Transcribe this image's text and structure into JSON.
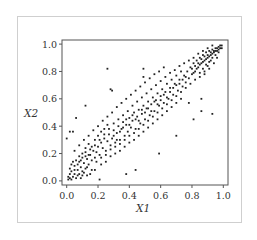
{
  "chart_data": {
    "type": "scatter",
    "title": "",
    "xlabel": "X1",
    "ylabel": "X2",
    "xlim": [
      -0.03,
      1.03
    ],
    "ylim": [
      -0.03,
      1.03
    ],
    "xticks": [
      0.0,
      0.2,
      0.4,
      0.6,
      0.8,
      1.0
    ],
    "yticks": [
      0.0,
      0.2,
      0.4,
      0.6,
      0.8,
      1.0
    ],
    "xtick_labels": [
      "0.0",
      "0.2",
      "0.4",
      "0.6",
      "0.8",
      "1.0"
    ],
    "ytick_labels": [
      "0.0",
      "0.2",
      "0.4",
      "0.6",
      "0.8",
      "1.0"
    ],
    "grid": false,
    "legend": null,
    "marker_color": "#222222",
    "series": [
      {
        "name": "samples",
        "description": "Strongly positively correlated bivariate sample on [0,1]x[0,1], dense near (0,0) and (1,1)",
        "points": [
          [
            0.26,
            0.82
          ],
          [
            0.49,
            0.82
          ],
          [
            0.12,
            0.55
          ],
          [
            0.06,
            0.46
          ],
          [
            0.0,
            0.31
          ],
          [
            0.02,
            0.36
          ],
          [
            0.04,
            0.36
          ],
          [
            0.93,
            0.49
          ],
          [
            0.81,
            0.45
          ],
          [
            0.7,
            0.33
          ],
          [
            0.59,
            0.2
          ],
          [
            0.44,
            0.08
          ],
          [
            0.38,
            0.05
          ],
          [
            0.21,
            0.01
          ],
          [
            0.86,
            0.51
          ],
          [
            0.78,
            0.57
          ],
          [
            0.86,
            0.6
          ],
          [
            0.49,
            0.76
          ],
          [
            0.28,
            0.67
          ],
          [
            0.29,
            0.66
          ],
          [
            0.01,
            0.01
          ],
          [
            0.02,
            0.02
          ],
          [
            0.01,
            0.03
          ],
          [
            0.03,
            0.01
          ],
          [
            0.02,
            0.05
          ],
          [
            0.04,
            0.03
          ],
          [
            0.03,
            0.07
          ],
          [
            0.05,
            0.05
          ],
          [
            0.06,
            0.02
          ],
          [
            0.02,
            0.09
          ],
          [
            0.07,
            0.08
          ],
          [
            0.05,
            0.11
          ],
          [
            0.08,
            0.05
          ],
          [
            0.09,
            0.1
          ],
          [
            0.1,
            0.07
          ],
          [
            0.04,
            0.14
          ],
          [
            0.06,
            0.15
          ],
          [
            0.11,
            0.13
          ],
          [
            0.12,
            0.09
          ],
          [
            0.13,
            0.16
          ],
          [
            0.14,
            0.12
          ],
          [
            0.15,
            0.19
          ],
          [
            0.08,
            0.18
          ],
          [
            0.1,
            0.2
          ],
          [
            0.16,
            0.15
          ],
          [
            0.17,
            0.22
          ],
          [
            0.18,
            0.17
          ],
          [
            0.12,
            0.24
          ],
          [
            0.14,
            0.27
          ],
          [
            0.19,
            0.21
          ],
          [
            0.2,
            0.25
          ],
          [
            0.21,
            0.19
          ],
          [
            0.22,
            0.28
          ],
          [
            0.23,
            0.24
          ],
          [
            0.24,
            0.31
          ],
          [
            0.25,
            0.22
          ],
          [
            0.26,
            0.29
          ],
          [
            0.27,
            0.34
          ],
          [
            0.28,
            0.26
          ],
          [
            0.29,
            0.31
          ],
          [
            0.3,
            0.37
          ],
          [
            0.31,
            0.28
          ],
          [
            0.32,
            0.35
          ],
          [
            0.33,
            0.4
          ],
          [
            0.34,
            0.3
          ],
          [
            0.35,
            0.38
          ],
          [
            0.36,
            0.43
          ],
          [
            0.37,
            0.33
          ],
          [
            0.38,
            0.41
          ],
          [
            0.39,
            0.36
          ],
          [
            0.4,
            0.46
          ],
          [
            0.41,
            0.39
          ],
          [
            0.42,
            0.44
          ],
          [
            0.43,
            0.5
          ],
          [
            0.44,
            0.38
          ],
          [
            0.45,
            0.47
          ],
          [
            0.46,
            0.52
          ],
          [
            0.47,
            0.42
          ],
          [
            0.48,
            0.49
          ],
          [
            0.49,
            0.55
          ],
          [
            0.5,
            0.45
          ],
          [
            0.51,
            0.53
          ],
          [
            0.52,
            0.58
          ],
          [
            0.53,
            0.48
          ],
          [
            0.54,
            0.56
          ],
          [
            0.55,
            0.61
          ],
          [
            0.56,
            0.51
          ],
          [
            0.57,
            0.59
          ],
          [
            0.58,
            0.64
          ],
          [
            0.59,
            0.55
          ],
          [
            0.6,
            0.62
          ],
          [
            0.61,
            0.67
          ],
          [
            0.62,
            0.57
          ],
          [
            0.63,
            0.65
          ],
          [
            0.64,
            0.71
          ],
          [
            0.65,
            0.6
          ],
          [
            0.66,
            0.68
          ],
          [
            0.67,
            0.74
          ],
          [
            0.68,
            0.63
          ],
          [
            0.69,
            0.71
          ],
          [
            0.7,
            0.77
          ],
          [
            0.71,
            0.66
          ],
          [
            0.72,
            0.74
          ],
          [
            0.73,
            0.8
          ],
          [
            0.74,
            0.69
          ],
          [
            0.75,
            0.77
          ],
          [
            0.76,
            0.72
          ],
          [
            0.77,
            0.8
          ],
          [
            0.78,
            0.75
          ],
          [
            0.79,
            0.83
          ],
          [
            0.8,
            0.78
          ],
          [
            0.81,
            0.86
          ],
          [
            0.82,
            0.8
          ],
          [
            0.83,
            0.88
          ],
          [
            0.84,
            0.83
          ],
          [
            0.85,
            0.9
          ],
          [
            0.86,
            0.86
          ],
          [
            0.87,
            0.92
          ],
          [
            0.88,
            0.88
          ],
          [
            0.89,
            0.94
          ],
          [
            0.9,
            0.9
          ],
          [
            0.91,
            0.95
          ],
          [
            0.92,
            0.92
          ],
          [
            0.93,
            0.96
          ],
          [
            0.94,
            0.94
          ],
          [
            0.95,
            0.97
          ],
          [
            0.96,
            0.95
          ],
          [
            0.97,
            0.98
          ],
          [
            0.98,
            0.97
          ],
          [
            0.99,
            0.99
          ],
          [
            0.95,
            0.92
          ],
          [
            0.93,
            0.9
          ],
          [
            0.91,
            0.87
          ],
          [
            0.89,
            0.85
          ],
          [
            0.87,
            0.82
          ],
          [
            0.85,
            0.79
          ],
          [
            0.97,
            0.94
          ],
          [
            0.92,
            0.88
          ],
          [
            0.9,
            0.84
          ],
          [
            0.88,
            0.8
          ],
          [
            0.15,
            0.05
          ],
          [
            0.18,
            0.08
          ],
          [
            0.22,
            0.12
          ],
          [
            0.25,
            0.14
          ],
          [
            0.28,
            0.18
          ],
          [
            0.31,
            0.2
          ],
          [
            0.34,
            0.22
          ],
          [
            0.37,
            0.25
          ],
          [
            0.4,
            0.28
          ],
          [
            0.43,
            0.3
          ],
          [
            0.46,
            0.33
          ],
          [
            0.49,
            0.36
          ],
          [
            0.52,
            0.39
          ],
          [
            0.55,
            0.42
          ],
          [
            0.58,
            0.45
          ],
          [
            0.61,
            0.48
          ],
          [
            0.64,
            0.51
          ],
          [
            0.67,
            0.54
          ],
          [
            0.7,
            0.57
          ],
          [
            0.73,
            0.6
          ],
          [
            0.05,
            0.22
          ],
          [
            0.08,
            0.26
          ],
          [
            0.11,
            0.3
          ],
          [
            0.14,
            0.33
          ],
          [
            0.17,
            0.37
          ],
          [
            0.2,
            0.4
          ],
          [
            0.23,
            0.44
          ],
          [
            0.26,
            0.47
          ],
          [
            0.29,
            0.5
          ],
          [
            0.32,
            0.54
          ],
          [
            0.35,
            0.57
          ],
          [
            0.38,
            0.6
          ],
          [
            0.41,
            0.63
          ],
          [
            0.44,
            0.66
          ],
          [
            0.47,
            0.69
          ],
          [
            0.5,
            0.72
          ],
          [
            0.53,
            0.75
          ],
          [
            0.56,
            0.78
          ],
          [
            0.59,
            0.8
          ],
          [
            0.62,
            0.83
          ],
          [
            0.1,
            0.04
          ],
          [
            0.13,
            0.1
          ],
          [
            0.16,
            0.08
          ],
          [
            0.19,
            0.14
          ],
          [
            0.22,
            0.17
          ],
          [
            0.25,
            0.19
          ],
          [
            0.28,
            0.23
          ],
          [
            0.31,
            0.25
          ],
          [
            0.34,
            0.27
          ],
          [
            0.37,
            0.3
          ],
          [
            0.4,
            0.33
          ],
          [
            0.43,
            0.35
          ],
          [
            0.46,
            0.38
          ],
          [
            0.49,
            0.41
          ],
          [
            0.52,
            0.44
          ],
          [
            0.55,
            0.47
          ],
          [
            0.58,
            0.5
          ],
          [
            0.61,
            0.53
          ],
          [
            0.64,
            0.56
          ],
          [
            0.67,
            0.59
          ],
          [
            0.07,
            0.12
          ],
          [
            0.09,
            0.15
          ],
          [
            0.12,
            0.18
          ],
          [
            0.15,
            0.23
          ],
          [
            0.18,
            0.26
          ],
          [
            0.21,
            0.3
          ],
          [
            0.24,
            0.34
          ],
          [
            0.27,
            0.38
          ],
          [
            0.3,
            0.42
          ],
          [
            0.33,
            0.45
          ],
          [
            0.36,
            0.48
          ],
          [
            0.39,
            0.51
          ],
          [
            0.42,
            0.55
          ],
          [
            0.45,
            0.58
          ],
          [
            0.48,
            0.61
          ],
          [
            0.51,
            0.64
          ],
          [
            0.54,
            0.67
          ],
          [
            0.57,
            0.7
          ],
          [
            0.6,
            0.73
          ],
          [
            0.63,
            0.76
          ],
          [
            0.66,
            0.79
          ],
          [
            0.69,
            0.81
          ],
          [
            0.72,
            0.84
          ],
          [
            0.75,
            0.86
          ],
          [
            0.78,
            0.88
          ],
          [
            0.81,
            0.9
          ],
          [
            0.84,
            0.93
          ],
          [
            0.87,
            0.95
          ],
          [
            0.9,
            0.97
          ],
          [
            0.93,
            0.99
          ],
          [
            0.7,
            0.62
          ],
          [
            0.73,
            0.65
          ],
          [
            0.76,
            0.68
          ],
          [
            0.79,
            0.71
          ],
          [
            0.82,
            0.74
          ],
          [
            0.85,
            0.76
          ],
          [
            0.88,
            0.78
          ],
          [
            0.91,
            0.82
          ],
          [
            0.94,
            0.86
          ],
          [
            0.96,
            0.9
          ],
          [
            0.03,
            0.12
          ],
          [
            0.05,
            0.08
          ],
          [
            0.07,
            0.04
          ],
          [
            0.09,
            0.02
          ],
          [
            0.11,
            0.06
          ],
          [
            0.13,
            0.04
          ],
          [
            0.08,
            0.14
          ],
          [
            0.1,
            0.17
          ],
          [
            0.12,
            0.21
          ],
          [
            0.14,
            0.19
          ],
          [
            0.16,
            0.25
          ],
          [
            0.18,
            0.3
          ],
          [
            0.2,
            0.33
          ],
          [
            0.22,
            0.36
          ],
          [
            0.24,
            0.38
          ],
          [
            0.26,
            0.41
          ],
          [
            0.3,
            0.33
          ],
          [
            0.32,
            0.3
          ],
          [
            0.34,
            0.36
          ],
          [
            0.36,
            0.39
          ],
          [
            0.38,
            0.45
          ],
          [
            0.4,
            0.41
          ],
          [
            0.42,
            0.48
          ],
          [
            0.44,
            0.45
          ],
          [
            0.46,
            0.44
          ],
          [
            0.48,
            0.52
          ],
          [
            0.5,
            0.5
          ],
          [
            0.52,
            0.53
          ],
          [
            0.54,
            0.51
          ],
          [
            0.56,
            0.58
          ],
          [
            0.58,
            0.56
          ],
          [
            0.6,
            0.59
          ],
          [
            0.62,
            0.63
          ],
          [
            0.64,
            0.61
          ],
          [
            0.66,
            0.65
          ],
          [
            0.68,
            0.68
          ],
          [
            0.7,
            0.7
          ],
          [
            0.72,
            0.71
          ],
          [
            0.74,
            0.74
          ],
          [
            0.76,
            0.76
          ],
          [
            0.8,
            0.82
          ],
          [
            0.82,
            0.84
          ],
          [
            0.84,
            0.86
          ],
          [
            0.86,
            0.89
          ],
          [
            0.88,
            0.91
          ],
          [
            0.9,
            0.92
          ],
          [
            0.92,
            0.94
          ],
          [
            0.94,
            0.95
          ],
          [
            0.96,
            0.97
          ],
          [
            0.98,
            0.99
          ],
          [
            0.99,
            0.97
          ],
          [
            0.97,
            0.96
          ],
          [
            0.95,
            0.95
          ],
          [
            0.93,
            0.93
          ],
          [
            0.91,
            0.91
          ],
          [
            0.89,
            0.89
          ],
          [
            0.87,
            0.87
          ],
          [
            0.85,
            0.85
          ],
          [
            0.83,
            0.82
          ],
          [
            0.81,
            0.79
          ]
        ]
      }
    ]
  }
}
